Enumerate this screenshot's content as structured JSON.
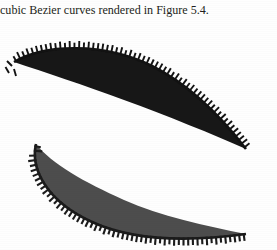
{
  "page": {
    "background_color": "#fefefe",
    "width": 277,
    "height": 250
  },
  "caption": {
    "text": "cubic Bezier curves rendered in Figure 5.4.",
    "color": "#231f20"
  },
  "figure": {
    "name": "bezier-curve-offset-figure",
    "shapes": [
      {
        "id": "upper-airfoil",
        "label": "upper-bezier-crescent",
        "fill_color": "#171717",
        "tick_color": "#121212",
        "tick_count": 58,
        "tick_length": 6.5,
        "tick_width": 1.9,
        "tick_side": "upper",
        "outline_path": "M 14 44 C 44 26, 104 24, 152 48 C 190 67, 222 100, 246 131 C 212 116, 168 98, 124 82 C 84 67, 44 54, 14 44 Z",
        "tick_base_path": "M 14 44 C 44 26, 104 24, 152 48 C 190 67, 222 100, 246 131",
        "leading_edge_marks": 3
      },
      {
        "id": "lower-airfoil",
        "label": "lower-bezier-crescent",
        "fill_color": "#4d4d4d",
        "tick_color": "#1b1b1b",
        "tick_count": 56,
        "tick_length": 6.5,
        "tick_width": 2.1,
        "tick_side": "lower",
        "outline_path": "M 36 126 C 30 152, 48 184, 92 204 C 140 226, 202 222, 246 216 C 206 208, 160 198, 124 182 C 84 164, 52 146, 36 126 Z",
        "tick_base_path": "M 36 126 C 30 152, 48 184, 92 204 C 140 226, 202 222, 246 216"
      }
    ]
  }
}
